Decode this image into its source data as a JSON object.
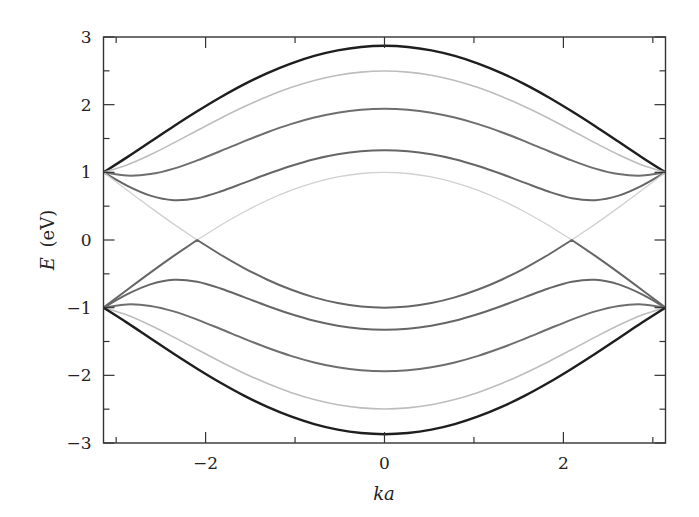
{
  "chart_data": {
    "type": "line",
    "title": "",
    "xlabel": "ka",
    "ylabel_var": "E",
    "ylabel_unit": "(eV)",
    "xlim": [
      -3.1416,
      3.1416
    ],
    "ylim": [
      -3,
      3
    ],
    "grid": false,
    "legend": null,
    "x_major_ticks": [
      -2,
      0,
      2
    ],
    "x_minor_ticks": [
      -3,
      -1,
      1,
      3
    ],
    "x_tick_labels": [
      "−2",
      "0",
      "2"
    ],
    "y_major_ticks": [
      -3,
      -2,
      -1,
      0,
      1,
      2,
      3
    ],
    "y_minor_ticks": [
      -2.5,
      -1.5,
      -0.5,
      0.5,
      1.5,
      2.5
    ],
    "y_tick_labels": [
      "−3",
      "−2",
      "−1",
      "0",
      "1",
      "2",
      "3"
    ],
    "x": [
      -3.1416,
      -2.8798,
      -2.618,
      -2.3562,
      -2.0944,
      -1.8326,
      -1.5708,
      -1.309,
      -1.0472,
      -0.7854,
      -0.5236,
      -0.2618,
      0,
      0.2618,
      0.5236,
      0.7854,
      1.0472,
      1.309,
      1.5708,
      1.8326,
      2.0944,
      2.3562,
      2.618,
      2.8798,
      3.1416
    ],
    "series": [
      {
        "name": "band-1-upper",
        "color": "#1e1e1e",
        "width": 2.4,
        "values": [
          1,
          1.221,
          1.451,
          1.681,
          1.902,
          2.11,
          2.3,
          2.467,
          2.608,
          2.721,
          2.803,
          2.853,
          2.87,
          2.853,
          2.803,
          2.721,
          2.608,
          2.467,
          2.3,
          2.11,
          1.902,
          1.681,
          1.451,
          1.221,
          1
        ]
      },
      {
        "name": "band-2-upper",
        "color": "#bdbdbd",
        "width": 1.6,
        "values": [
          1,
          1.109,
          1.26,
          1.435,
          1.618,
          1.799,
          1.968,
          2.121,
          2.252,
          2.357,
          2.434,
          2.481,
          2.497,
          2.481,
          2.434,
          2.357,
          2.252,
          2.121,
          1.968,
          1.799,
          1.618,
          1.435,
          1.26,
          1.109,
          1
        ]
      },
      {
        "name": "band-3-upper",
        "color": "#6e6e6e",
        "width": 2.0,
        "values": [
          1,
          0.952,
          0.974,
          1.055,
          1.176,
          1.315,
          1.458,
          1.593,
          1.712,
          1.809,
          1.881,
          1.925,
          1.94,
          1.925,
          1.881,
          1.809,
          1.712,
          1.593,
          1.458,
          1.315,
          1.176,
          1.055,
          0.974,
          0.952,
          1
        ]
      },
      {
        "name": "band-4-upper",
        "color": "#666666",
        "width": 2.0,
        "values": [
          1,
          0.804,
          0.656,
          0.589,
          0.618,
          0.716,
          0.844,
          0.975,
          1.094,
          1.194,
          1.267,
          1.313,
          1.328,
          1.313,
          1.267,
          1.194,
          1.094,
          0.975,
          0.844,
          0.716,
          0.618,
          0.589,
          0.656,
          0.804,
          1
        ]
      },
      {
        "name": "band-5-upper",
        "color": "#d0d0d0",
        "width": 1.3,
        "values": [
          1,
          0.739,
          0.482,
          0.235,
          0,
          0.218,
          0.414,
          0.587,
          0.732,
          0.848,
          0.932,
          0.983,
          1,
          0.983,
          0.932,
          0.848,
          0.732,
          0.587,
          0.414,
          0.218,
          0,
          0.235,
          0.482,
          0.739,
          1
        ]
      },
      {
        "name": "band-5-lower",
        "color": "#666666",
        "width": 2.0,
        "values": [
          -1,
          -0.739,
          -0.482,
          -0.235,
          0,
          -0.218,
          -0.414,
          -0.587,
          -0.732,
          -0.848,
          -0.932,
          -0.983,
          -1,
          -0.983,
          -0.932,
          -0.848,
          -0.732,
          -0.587,
          -0.414,
          -0.218,
          0,
          -0.235,
          -0.482,
          -0.739,
          -1
        ]
      },
      {
        "name": "band-4-lower",
        "color": "#666666",
        "width": 2.0,
        "values": [
          -1,
          -0.804,
          -0.656,
          -0.589,
          -0.618,
          -0.716,
          -0.844,
          -0.975,
          -1.094,
          -1.194,
          -1.267,
          -1.313,
          -1.328,
          -1.313,
          -1.267,
          -1.194,
          -1.094,
          -0.975,
          -0.844,
          -0.716,
          -0.618,
          -0.589,
          -0.656,
          -0.804,
          -1
        ]
      },
      {
        "name": "band-3-lower",
        "color": "#6e6e6e",
        "width": 2.0,
        "values": [
          -1,
          -0.952,
          -0.974,
          -1.055,
          -1.176,
          -1.315,
          -1.458,
          -1.593,
          -1.712,
          -1.809,
          -1.881,
          -1.925,
          -1.94,
          -1.925,
          -1.881,
          -1.809,
          -1.712,
          -1.593,
          -1.458,
          -1.315,
          -1.176,
          -1.055,
          -0.974,
          -0.952,
          -1
        ]
      },
      {
        "name": "band-2-lower",
        "color": "#bdbdbd",
        "width": 1.6,
        "values": [
          -1,
          -1.109,
          -1.26,
          -1.435,
          -1.618,
          -1.799,
          -1.968,
          -2.121,
          -2.252,
          -2.357,
          -2.434,
          -2.481,
          -2.497,
          -2.481,
          -2.434,
          -2.357,
          -2.252,
          -2.121,
          -1.968,
          -1.799,
          -1.618,
          -1.435,
          -1.26,
          -1.109,
          -1
        ]
      },
      {
        "name": "band-1-lower",
        "color": "#1e1e1e",
        "width": 2.4,
        "values": [
          -1,
          -1.221,
          -1.451,
          -1.681,
          -1.902,
          -2.11,
          -2.3,
          -2.467,
          -2.608,
          -2.721,
          -2.803,
          -2.853,
          -2.87,
          -2.853,
          -2.803,
          -2.721,
          -2.608,
          -2.467,
          -2.3,
          -2.11,
          -1.902,
          -1.681,
          -1.451,
          -1.221,
          -1
        ]
      }
    ]
  },
  "layout": {
    "plot_left": 103.5,
    "plot_right": 665.5,
    "plot_top": 37,
    "plot_bottom": 443,
    "axis_color": "#333333"
  }
}
